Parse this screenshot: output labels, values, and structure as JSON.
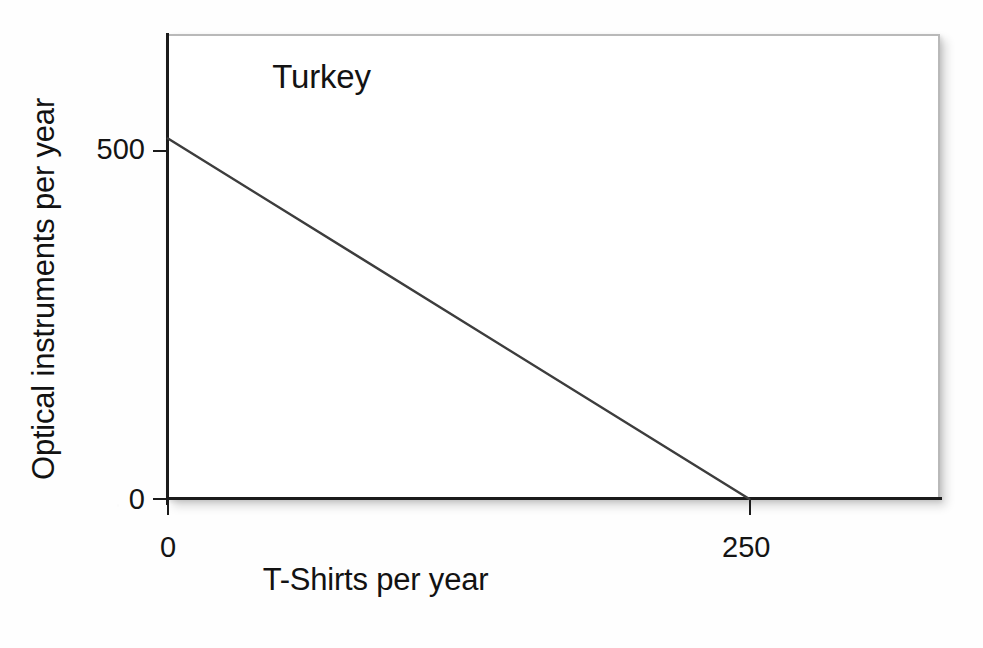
{
  "figure": {
    "title": "Turkey",
    "background_color": "#ffffff",
    "frame_color": "#b9b9b9",
    "axis_color": "#1b1b1b",
    "line_color": "#3d3d3d"
  },
  "axes": {
    "x": {
      "label": "T-Shirts per year",
      "ticks": [
        "0",
        "250"
      ]
    },
    "y": {
      "label": "Optical instruments per year",
      "ticks": [
        "500",
        "0"
      ]
    }
  },
  "chart_data": {
    "type": "line",
    "title": "Turkey",
    "subtitle": "",
    "xlabel": "T-Shirts per year",
    "ylabel": "Optical instruments per year",
    "xlim": [
      0,
      332
    ],
    "ylim": [
      0,
      645
    ],
    "xticks": [
      0,
      250
    ],
    "xticklabels": [
      "0",
      "250"
    ],
    "yticks": [
      0,
      500
    ],
    "yticklabels": [
      "0",
      "500"
    ],
    "grid": false,
    "legend": false,
    "annotations": [
      {
        "text": "Turkey",
        "x": 160,
        "y": 600
      }
    ],
    "series": [
      {
        "name": "Production possibilities frontier",
        "x": [
          0,
          250
        ],
        "y": [
          500,
          0
        ],
        "color": "#3d3d3d",
        "linewidth": 2.5,
        "style": "solid"
      }
    ]
  }
}
